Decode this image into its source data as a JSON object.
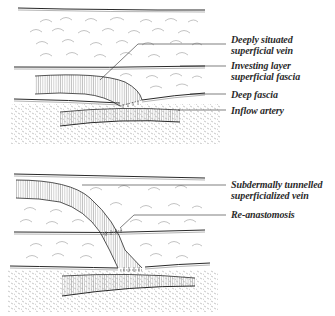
{
  "diagram": {
    "type": "surgical-anatomy-illustration",
    "colors": {
      "ink": "#2a2a2a",
      "hatch": "#8a8a8a",
      "background": "#ffffff"
    },
    "top_panel": {
      "description": "Deeply situated vein before superficialization",
      "labels": [
        {
          "line1": "Deeply situated",
          "line2": "superficial vein"
        },
        {
          "line1": "Investing layer",
          "line2": "superficial fascia"
        },
        {
          "line1": "Deep fascia"
        },
        {
          "line1": "Inflow artery"
        }
      ]
    },
    "bottom_panel": {
      "description": "Vein tunnelled subdermally and re-anastomosed",
      "labels": [
        {
          "line1": "Subdermally tunnelled",
          "line2": "superficialized vein"
        },
        {
          "line1": "Re-anastomosis"
        }
      ]
    }
  }
}
